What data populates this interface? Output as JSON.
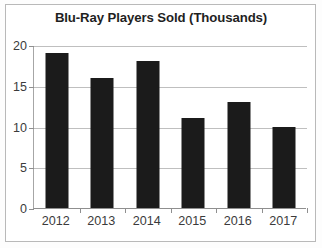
{
  "chart_data": {
    "type": "bar",
    "title": "Blu-Ray Players Sold (Thousands)",
    "xlabel": "",
    "ylabel": "",
    "categories": [
      "2012",
      "2013",
      "2014",
      "2015",
      "2016",
      "2017"
    ],
    "values": [
      19,
      16,
      18,
      11,
      13,
      10
    ],
    "yticks": [
      0,
      5,
      10,
      15,
      20
    ],
    "ytick_labels": [
      "0",
      "5",
      "10",
      "15",
      "20"
    ],
    "ylim": [
      0,
      20
    ],
    "grid": "horizontal",
    "legend": "none",
    "bar_color": "#1b1b1b",
    "gridline_color": "#bfbfbf",
    "axis_color": "#8f8f8f",
    "title_color": "#1f1f1f",
    "tick_label_color": "#3b3b3b",
    "background_color": "#ffffff",
    "frame_color": "#b9b9b9"
  }
}
